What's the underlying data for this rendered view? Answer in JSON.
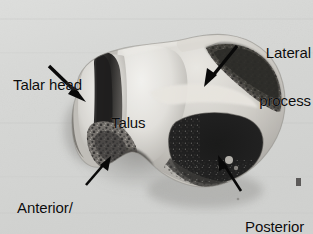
{
  "figure": {
    "type": "anatomical-photograph",
    "background_color": "#d7d8d6",
    "ink_color": "#0c0c0c",
    "width": 313,
    "height": 234
  },
  "labels": {
    "talar_head": {
      "name": "talar-head",
      "lines": [
        "Talar head"
      ],
      "x": 13,
      "y": 45
    },
    "talus": {
      "name": "talus",
      "lines": [
        "Talus"
      ],
      "x": 111,
      "y": 83
    },
    "lateral_process": {
      "name": "lateral-process",
      "lines": [
        "Lateral",
        "process"
      ],
      "x": 219,
      "y": 13
    },
    "anterior_middle_facets": {
      "name": "anterior-middle-facets",
      "lines": [
        "Anterior/",
        "middle facets"
      ],
      "x": 17,
      "y": 168
    },
    "posterior_facet": {
      "name": "posterior-facet",
      "lines": [
        "Posterior",
        "facet"
      ],
      "x": 245,
      "y": 187
    }
  },
  "arrows": [
    {
      "name": "arrow-talar-head",
      "from": [
        49,
        66
      ],
      "to": [
        84,
        100
      ]
    },
    {
      "name": "arrow-lateral-process",
      "from": [
        236,
        47
      ],
      "to": [
        206,
        84
      ]
    },
    {
      "name": "arrow-anterior-middle-facets",
      "from": [
        87,
        184
      ],
      "to": [
        110,
        157
      ]
    },
    {
      "name": "arrow-posterior-facet",
      "from": [
        240,
        190
      ],
      "to": [
        219,
        156
      ]
    }
  ],
  "specimen": {
    "regions": [
      {
        "name": "talar-head-lobe",
        "tone": "bright-bone"
      },
      {
        "name": "talar-neck-groove",
        "tone": "dark-shadow"
      },
      {
        "name": "talus-body",
        "tone": "bright-bone"
      },
      {
        "name": "posterior-facet-cavity",
        "tone": "deep-black"
      },
      {
        "name": "lateral-process-edge",
        "tone": "mottled-dark"
      },
      {
        "name": "anterior-middle-facet-surface",
        "tone": "mottled-mid"
      },
      {
        "name": "cast-shadow",
        "tone": "soft-gray"
      }
    ]
  }
}
